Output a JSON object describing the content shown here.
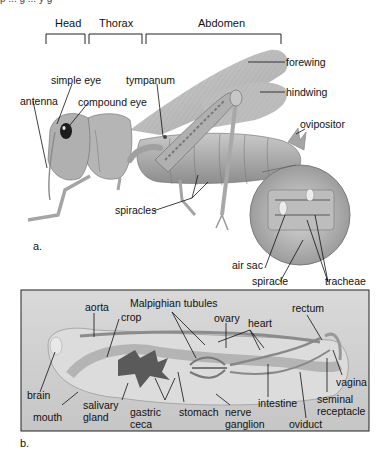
{
  "figure": {
    "top_cutoff_text": "p    ...    g    ...    y  g",
    "sections": {
      "head": "Head",
      "thorax": "Thorax",
      "abdomen": "Abdomen"
    },
    "panel_a": {
      "letter": "a.",
      "labels": {
        "simple_eye": "simple eye",
        "antenna": "antenna",
        "compound_eye": "compound eye",
        "tympanum": "tympanum",
        "forewing": "forewing",
        "hindwing": "hindwing",
        "ovipositor": "ovipositor",
        "spiracles": "spiracles",
        "air_sac": "air sac",
        "spiracle": "spiracle",
        "tracheae": "tracheae"
      }
    },
    "panel_b": {
      "letter": "b.",
      "labels": {
        "aorta": "aorta",
        "malpighian_tubules": "Malpighian tubules",
        "crop": "crop",
        "ovary": "ovary",
        "heart": "heart",
        "rectum": "rectum",
        "brain": "brain",
        "mouth": "mouth",
        "salivary_gland_1": "salivary",
        "salivary_gland_2": "gland",
        "gastric_ceca_1": "gastric",
        "gastric_ceca_2": "ceca",
        "stomach": "stomach",
        "nerve_ganglion_1": "nerve",
        "nerve_ganglion_2": "ganglion",
        "intestine": "intestine",
        "oviduct": "oviduct",
        "vagina": "vagina",
        "seminal_receptacle_1": "seminal",
        "seminal_receptacle_2": "receptacle"
      }
    },
    "colors": {
      "panel_bg": "#d2d2d2",
      "body_gray": "#9a9a9a",
      "wing_gray": "#b8b8b8",
      "gut_dark": "#6e6e6e",
      "line": "#111111"
    }
  }
}
